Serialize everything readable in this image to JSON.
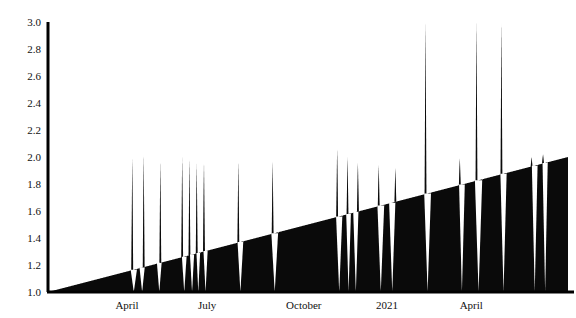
{
  "chart_data": {
    "type": "line",
    "title": "",
    "subtitle": "",
    "xlabel": "",
    "ylabel": "",
    "ylim": [
      1.0,
      3.0
    ],
    "grid": false,
    "legend": null,
    "fill_to_baseline": true,
    "baseline": 1.0,
    "colors": {
      "series": "#0a0a0a",
      "axis": "#000000",
      "background": "#ffffff",
      "text": "#111111"
    },
    "yticks": [
      1.0,
      1.2,
      1.4,
      1.6,
      1.8,
      2.0,
      2.2,
      2.4,
      2.6,
      2.8,
      3.0
    ],
    "ytick_labels": [
      "1.0",
      "1.2",
      "1.4",
      "1.6",
      "1.8",
      "2.0",
      "2.2",
      "2.4",
      "2.6",
      "2.8",
      "3.0"
    ],
    "xticks": [
      0.152,
      0.306,
      0.492,
      0.652,
      0.814
    ],
    "xtick_labels": [
      "April",
      "July",
      "October",
      "2021",
      "April"
    ],
    "x_domain_note": "x values below are normalized 0..1 across the plotted time span",
    "series": [
      {
        "name": "value",
        "description": "Dense sawtooth series: slowly rising upper envelope from 1.00 to about 2.00, punctuated by sharp drops back to 1.00 and occasional tall spikes reaching up to 3.00.",
        "envelope": {
          "start": 1.0,
          "end": 2.0,
          "type": "linear_rising"
        },
        "drops": [
          {
            "x": 0.165,
            "depth": 1.0,
            "width": 0.012
          },
          {
            "x": 0.181,
            "depth": 1.0,
            "width": 0.01
          },
          {
            "x": 0.214,
            "depth": 1.0,
            "width": 0.009
          },
          {
            "x": 0.262,
            "depth": 1.0,
            "width": 0.009
          },
          {
            "x": 0.277,
            "depth": 1.0,
            "width": 0.008
          },
          {
            "x": 0.289,
            "depth": 1.0,
            "width": 0.007
          },
          {
            "x": 0.303,
            "depth": 1.0,
            "width": 0.008
          },
          {
            "x": 0.37,
            "depth": 1.0,
            "width": 0.011
          },
          {
            "x": 0.436,
            "depth": 1.0,
            "width": 0.013
          },
          {
            "x": 0.56,
            "depth": 1.0,
            "width": 0.012
          },
          {
            "x": 0.578,
            "depth": 1.0,
            "width": 0.009
          },
          {
            "x": 0.592,
            "depth": 1.0,
            "width": 0.01
          },
          {
            "x": 0.64,
            "depth": 1.0,
            "width": 0.013
          },
          {
            "x": 0.662,
            "depth": 1.0,
            "width": 0.012
          },
          {
            "x": 0.73,
            "depth": 1.0,
            "width": 0.013
          },
          {
            "x": 0.796,
            "depth": 1.0,
            "width": 0.011
          },
          {
            "x": 0.828,
            "depth": 1.0,
            "width": 0.014
          },
          {
            "x": 0.876,
            "depth": 1.0,
            "width": 0.012
          },
          {
            "x": 0.936,
            "depth": 1.0,
            "width": 0.011
          },
          {
            "x": 0.956,
            "depth": 1.0,
            "width": 0.01
          }
        ],
        "spikes": [
          {
            "x": 0.162,
            "peak": 2.0
          },
          {
            "x": 0.184,
            "peak": 2.02
          },
          {
            "x": 0.216,
            "peak": 1.97
          },
          {
            "x": 0.258,
            "peak": 2.0
          },
          {
            "x": 0.272,
            "peak": 1.99
          },
          {
            "x": 0.286,
            "peak": 1.95
          },
          {
            "x": 0.3,
            "peak": 1.96
          },
          {
            "x": 0.366,
            "peak": 1.97
          },
          {
            "x": 0.432,
            "peak": 1.97
          },
          {
            "x": 0.556,
            "peak": 2.06
          },
          {
            "x": 0.576,
            "peak": 2.0
          },
          {
            "x": 0.596,
            "peak": 1.96
          },
          {
            "x": 0.636,
            "peak": 1.94
          },
          {
            "x": 0.668,
            "peak": 1.92
          },
          {
            "x": 0.726,
            "peak": 3.0
          },
          {
            "x": 0.792,
            "peak": 1.99
          },
          {
            "x": 0.824,
            "peak": 3.0
          },
          {
            "x": 0.872,
            "peak": 3.0
          },
          {
            "x": 0.93,
            "peak": 2.0
          },
          {
            "x": 0.952,
            "peak": 2.02
          }
        ]
      }
    ]
  },
  "axes": {
    "y_axis_name": "y-axis",
    "x_axis_name": "x-axis"
  }
}
